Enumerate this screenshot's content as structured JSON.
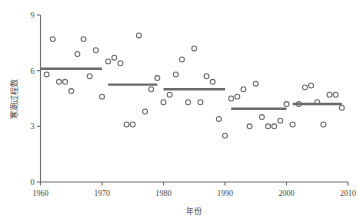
{
  "chart_data": {
    "type": "scatter",
    "title": "",
    "xlabel": "年份",
    "ylabel": "寒潮过程数",
    "xlim": [
      1960,
      2010
    ],
    "ylim": [
      0,
      9
    ],
    "grid": false,
    "legend": "none",
    "xticks": [
      "1960",
      "1970",
      "1980",
      "1990",
      "2000",
      "2010"
    ],
    "xtick_values": [
      1960,
      1970,
      1980,
      1990,
      2000,
      2010
    ],
    "yticks": [
      "0",
      "3",
      "6",
      "9"
    ],
    "ytick_values": [
      0,
      3,
      6,
      9
    ],
    "marker": "open-circle",
    "marker_color": "#6a6a6a",
    "series": [
      {
        "name": "寒潮过程数",
        "x": [
          1961,
          1962,
          1963,
          1964,
          1965,
          1966,
          1967,
          1968,
          1969,
          1970,
          1971,
          1972,
          1973,
          1974,
          1975,
          1976,
          1977,
          1978,
          1979,
          1980,
          1981,
          1982,
          1983,
          1984,
          1985,
          1986,
          1987,
          1988,
          1989,
          1990,
          1991,
          1992,
          1993,
          1994,
          1995,
          1996,
          1997,
          1998,
          1999,
          2000,
          2001,
          2002,
          2003,
          2004,
          2005,
          2006,
          2007,
          2008,
          2009
        ],
        "values": [
          5.8,
          7.7,
          5.4,
          5.4,
          4.9,
          6.9,
          7.7,
          5.7,
          7.1,
          4.6,
          6.5,
          6.7,
          6.4,
          3.1,
          3.1,
          7.9,
          3.8,
          5.0,
          5.6,
          4.3,
          4.7,
          5.8,
          6.6,
          4.3,
          7.2,
          4.3,
          5.7,
          5.4,
          3.4,
          2.5,
          4.5,
          4.6,
          5.0,
          3.0,
          5.3,
          3.5,
          3.0,
          3.0,
          3.3,
          4.2,
          3.1,
          4.2,
          5.1,
          5.2,
          4.3,
          3.1,
          4.7,
          4.7,
          4.0
        ]
      }
    ],
    "trend_segments": [
      {
        "x_start": 1960,
        "x_end": 1970,
        "value": 6.1
      },
      {
        "x_start": 1971,
        "x_end": 1979,
        "value": 5.25
      },
      {
        "x_start": 1980,
        "x_end": 1990,
        "value": 5.0
      },
      {
        "x_start": 1991,
        "x_end": 2000,
        "value": 3.95
      },
      {
        "x_start": 2001,
        "x_end": 2009,
        "value": 4.2
      }
    ],
    "trend_color": "#6a6a6a"
  }
}
